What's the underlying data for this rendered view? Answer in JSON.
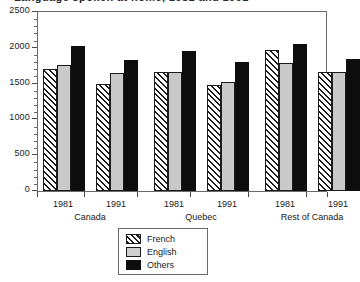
{
  "figure": {
    "title_cropped": "Language spoken at home, 1981 and 1991",
    "legend_position": "below-axis-left-of-center"
  },
  "chart_data": {
    "type": "bar",
    "title": "Language spoken at home, 1981 and 1991",
    "xlabel": "",
    "ylabel": "",
    "ylim": [
      0,
      2500
    ],
    "yticks": [
      0,
      500,
      1000,
      1500,
      2000,
      2500
    ],
    "ytick_labels": [
      "0",
      "500",
      "1000",
      "1500",
      "2000",
      "2500"
    ],
    "minor_tick_interval": 100,
    "grid": false,
    "groups": [
      "Canada",
      "Quebec",
      "Rest of Canada"
    ],
    "categories": [
      "Canada 1981",
      "Canada 1991",
      "Quebec 1981",
      "Quebec 1991",
      "Rest of Canada 1981",
      "Rest of Canada 1991"
    ],
    "years": [
      "1981",
      "1991",
      "1981",
      "1991",
      "1981",
      "1991"
    ],
    "series": [
      {
        "name": "French",
        "values": [
          1710,
          1495,
          1665,
          1480,
          1975,
          1665
        ]
      },
      {
        "name": "English",
        "values": [
          1760,
          1645,
          1660,
          1520,
          1785,
          1660
        ]
      },
      {
        "name": "Others",
        "values": [
          2030,
          1825,
          1955,
          1805,
          2055,
          1840
        ]
      }
    ],
    "legend": [
      "French",
      "English",
      "Others"
    ],
    "colors": {
      "french": "#ffffff",
      "french_hatch": "#1c1c1c",
      "english": "#c9c9c9",
      "others": "#0d0d0d",
      "axis": "#4a4a4a",
      "frame": "#6a6a6a"
    }
  },
  "axis": {
    "y_labels": [
      "2500",
      "2000",
      "1500",
      "1000",
      "500",
      "0"
    ],
    "x_years": [
      "1981",
      "1991",
      "1981",
      "1991",
      "1981",
      "1991"
    ],
    "x_groups": [
      "Canada",
      "Quebec",
      "Rest of Canada"
    ]
  },
  "legend": {
    "items": [
      {
        "label": "French",
        "swatch": "hatch-swatch"
      },
      {
        "label": "English",
        "swatch": "gray-swatch"
      },
      {
        "label": "Others",
        "swatch": "black-swatch"
      }
    ]
  }
}
